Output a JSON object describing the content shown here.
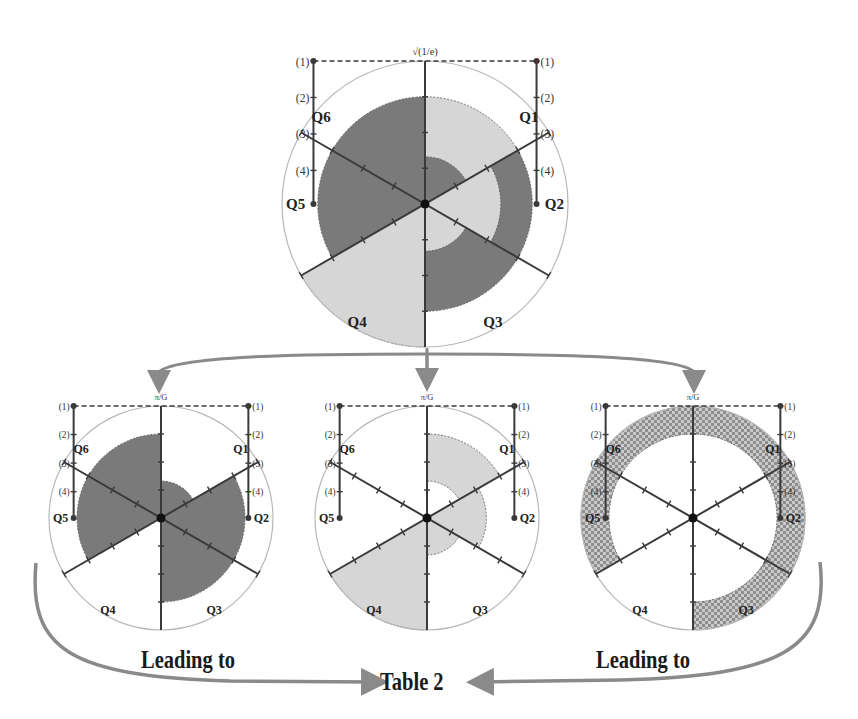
{
  "colors": {
    "dark": "#7a7a7a",
    "light": "#d6d6d6",
    "axis": "#3a3a3a",
    "circle": "#b8b8b8",
    "arrow": "#8a8a8a",
    "checker_a": "#8e8e8e",
    "checker_b": "#c9c9c9"
  },
  "top_axis_label": "√(1/e)",
  "sub_axis_label": "π/G",
  "scale_marks": [
    "(1)",
    "(2)",
    "(3)",
    "(4)"
  ],
  "diagrams": [
    {
      "id": "top",
      "cx": 425,
      "cy": 204,
      "r": 143,
      "fontsize": 15,
      "axis_label": "√(1/e)",
      "sectors": [
        {
          "q": "Q1",
          "fill": "light",
          "r0": 0.0,
          "r1": 0.75
        },
        {
          "q": "Q1",
          "fill": "dark",
          "r0": 0.0,
          "r1": 0.33
        },
        {
          "q": "Q2",
          "fill": "dark",
          "r0": 0.0,
          "r1": 0.75
        },
        {
          "q": "Q2",
          "fill": "light",
          "r0": 0.0,
          "r1": 0.53
        },
        {
          "q": "Q3",
          "fill": "dark",
          "r0": 0.0,
          "r1": 0.75
        },
        {
          "q": "Q3",
          "fill": "light",
          "r0": 0.0,
          "r1": 0.33
        },
        {
          "q": "Q4",
          "fill": "light",
          "r0": 0.0,
          "r1": 1.0
        },
        {
          "q": "Q5",
          "fill": "dark",
          "r0": 0.0,
          "r1": 0.75
        },
        {
          "q": "Q6",
          "fill": "dark",
          "r0": 0.0,
          "r1": 0.75
        }
      ]
    },
    {
      "id": "bottom-left",
      "cx": 161,
      "cy": 518,
      "r": 112,
      "fontsize": 12,
      "axis_label": "π/G",
      "sectors": [
        {
          "q": "Q1",
          "fill": "dark",
          "r0": 0.0,
          "r1": 0.33
        },
        {
          "q": "Q2",
          "fill": "dark",
          "r0": 0.0,
          "r1": 0.75
        },
        {
          "q": "Q3",
          "fill": "dark",
          "r0": 0.0,
          "r1": 0.75
        },
        {
          "q": "Q5",
          "fill": "dark",
          "r0": 0.0,
          "r1": 0.75
        },
        {
          "q": "Q6",
          "fill": "dark",
          "r0": 0.0,
          "r1": 0.75
        }
      ]
    },
    {
      "id": "bottom-middle",
      "cx": 427,
      "cy": 518,
      "r": 112,
      "fontsize": 12,
      "axis_label": "π/G",
      "sectors": [
        {
          "q": "Q1",
          "fill": "light",
          "r0": 0.33,
          "r1": 0.75
        },
        {
          "q": "Q2",
          "fill": "light",
          "r0": 0.0,
          "r1": 0.53
        },
        {
          "q": "Q3",
          "fill": "light",
          "r0": 0.0,
          "r1": 0.33
        },
        {
          "q": "Q4",
          "fill": "light",
          "r0": 0.0,
          "r1": 1.0
        }
      ]
    },
    {
      "id": "bottom-right",
      "cx": 693,
      "cy": 518,
      "r": 112,
      "fontsize": 12,
      "axis_label": "π/G",
      "sectors": [
        {
          "q": "Q1",
          "fill": "checker",
          "r0": 0.75,
          "r1": 1.0
        },
        {
          "q": "Q2",
          "fill": "checker",
          "r0": 0.75,
          "r1": 1.0
        },
        {
          "q": "Q3",
          "fill": "checker",
          "r0": 0.75,
          "r1": 1.0
        },
        {
          "q": "Q5",
          "fill": "checker",
          "r0": 0.75,
          "r1": 1.0
        },
        {
          "q": "Q6",
          "fill": "checker",
          "r0": 0.75,
          "r1": 1.0
        }
      ]
    }
  ],
  "quadrant_labels": [
    "Q1",
    "Q2",
    "Q3",
    "Q4",
    "Q5",
    "Q6"
  ],
  "captions": {
    "left": "Leading to",
    "right": "Leading to",
    "center": "Table 2"
  }
}
